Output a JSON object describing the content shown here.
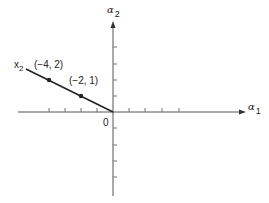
{
  "diagram": {
    "title": "",
    "axes": {
      "x_label": "α",
      "x_label_sub": "1",
      "y_label": "α",
      "y_label_sub": "2",
      "origin_label": "0",
      "tick_spacing_units": 1
    },
    "line": {
      "label": "x",
      "label_sub": "2",
      "description": "ray from origin through (-2,1) and (-4,2)"
    },
    "points": [
      {
        "label": "(−4, 2)",
        "x": -4,
        "y": 2
      },
      {
        "label": "(−2, 1)",
        "x": -2,
        "y": 1
      }
    ],
    "colors": {
      "ink": "#222222",
      "axis": "#555555",
      "background": "#ffffff"
    }
  }
}
